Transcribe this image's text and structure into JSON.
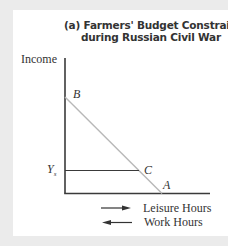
{
  "figure": {
    "title_line1": "(a) Farmers' Budget Constraint",
    "title_line2": "during Russian Civil War",
    "y_axis_label": "Income",
    "points": {
      "B": "B",
      "C": "C",
      "A": "A"
    },
    "ys_label": "Y",
    "ys_subscript": "s",
    "legend": [
      {
        "direction": "right-arrow-icon",
        "label": "Leisure Hours"
      },
      {
        "direction": "left-arrow-icon",
        "label": "Work Hours"
      }
    ],
    "colors": {
      "axis": "#3a3a3a",
      "budget_line": "#b8b8b8",
      "ys_line": "#3a3a3a",
      "background": "#ebebeb",
      "panel": "#ffffff"
    }
  }
}
